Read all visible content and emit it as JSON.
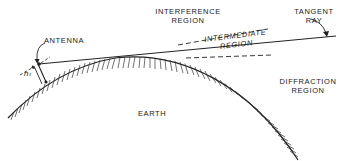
{
  "labels": {
    "interference": [
      "INTERFERENCE",
      "REGION"
    ],
    "tangent_ray": [
      "TANGENT",
      "RAY"
    ],
    "antenna": "ANTENNA",
    "intermediate": [
      "INTERMEDIATE",
      "REGION"
    ],
    "diffraction": [
      "DIFFRACTION",
      "REGION"
    ],
    "earth": "EARTH",
    "antenna_height": "hₜ"
  },
  "colors": {
    "ink": "#222222",
    "background": "#ffffff"
  }
}
